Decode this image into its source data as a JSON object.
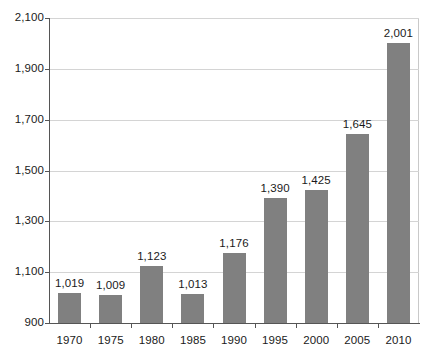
{
  "chart_data": {
    "type": "bar",
    "title": "",
    "xlabel": "",
    "ylabel": "",
    "categories": [
      "1970",
      "1975",
      "1980",
      "1985",
      "1990",
      "1995",
      "2000",
      "2005",
      "2010"
    ],
    "values": [
      1019,
      1009,
      1123,
      1013,
      1176,
      1390,
      1425,
      1645,
      2001
    ],
    "value_labels": [
      "1,019",
      "1,009",
      "1,123",
      "1,013",
      "1,176",
      "1,390",
      "1,425",
      "1,645",
      "2,001"
    ],
    "ylim": [
      900,
      2100
    ],
    "y_ticks": [
      900,
      1100,
      1300,
      1500,
      1700,
      1900,
      2100
    ],
    "y_tick_labels": [
      "900",
      "1,100",
      "1,300",
      "1,500",
      "1,700",
      "1,900",
      "2,100"
    ],
    "grid": true,
    "grid_axis": "y",
    "legend": false,
    "legend_position": "none",
    "bar_color": "#808080",
    "grid_color": "#d4d4d4",
    "axis_color": "#555555",
    "background_color": "#ffffff",
    "text_color": "#1a1a1a"
  }
}
